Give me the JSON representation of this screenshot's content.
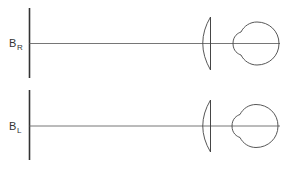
{
  "diagram": {
    "panels": [
      {
        "id": "right",
        "label_main": "B",
        "label_sub": "R"
      },
      {
        "id": "left",
        "label_main": "B",
        "label_sub": "L"
      }
    ],
    "colors": {
      "stroke": "#333333",
      "axis": "#555555",
      "background": "#ffffff"
    }
  }
}
